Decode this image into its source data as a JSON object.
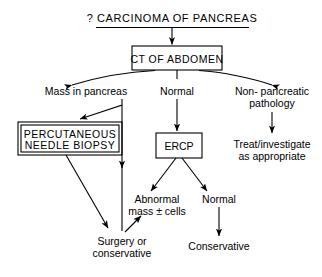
{
  "diagram": {
    "title": "? CARCINOMA OF PANCREAS",
    "nodes": {
      "ct_of_abdomen": "CT OF ABDOMEN",
      "mass_in_pancreas": "Mass in pancreas",
      "normal_ct": "Normal",
      "non_pancreatic_line1": "Non- pancreatic",
      "non_pancreatic_line2": "pathology",
      "percutaneous_line1": "PERCUTANEOUS",
      "percutaneous_line2": "NEEDLE BIOPSY",
      "ercp": "ERCP",
      "treat_line1": "Treat/investigate",
      "treat_line2": "as appropriate",
      "abnormal_line1": "Abnormal",
      "abnormal_line2": "mass ± cells",
      "normal_ercp": "Normal",
      "surgery_line1": "Surgery or",
      "surgery_line2": "conservative",
      "conservative": "Conservative"
    },
    "colors": {
      "ink": "#000000",
      "background": "#ffffff"
    }
  }
}
